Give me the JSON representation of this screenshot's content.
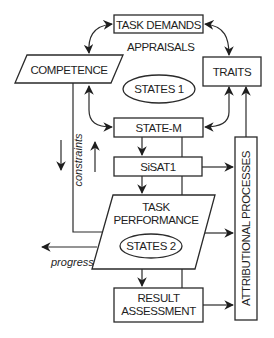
{
  "diagram": {
    "nodes": {
      "task_demands": "TASK DEMANDS",
      "appraisals": "APPRAISALS",
      "competence": "COMPETENCE",
      "traits": "TRAITS",
      "states1": "STATES 1",
      "state_m": "STATE-M",
      "sisat1": "SiSAT1",
      "task_performance_line1": "TASK",
      "task_performance_line2": "PERFORMANCE",
      "states2": "STATES 2",
      "result_assessment_line1": "RESULT",
      "result_assessment_line2": "ASSESSMENT",
      "attributional_processes": "ATTRIBUTIONAL PROCESSES"
    },
    "edge_labels": {
      "constraints": "constraints",
      "progress": "progress"
    },
    "edges": [
      {
        "from": "task_demands",
        "to": "competence",
        "type": "bidirectional"
      },
      {
        "from": "task_demands",
        "to": "traits",
        "type": "bidirectional"
      },
      {
        "from": "competence",
        "to": "state_m",
        "type": "bidirectional"
      },
      {
        "from": "traits",
        "to": "state_m",
        "type": "directed"
      },
      {
        "from": "attributional_processes",
        "to": "traits",
        "type": "directed"
      },
      {
        "from": "state_m",
        "to": "sisat1",
        "type": "directed"
      },
      {
        "from": "sisat1",
        "to": "task_performance",
        "type": "directed"
      },
      {
        "from": "sisat1",
        "to": "attributional_processes",
        "type": "directed"
      },
      {
        "from": "competence",
        "to": "task_performance",
        "type": "line",
        "label": "constraints"
      },
      {
        "from": "task_performance",
        "to": "attributional_processes",
        "type": "directed"
      },
      {
        "from": "task_performance",
        "to": "outside",
        "type": "directed",
        "label": "progress"
      },
      {
        "from": "task_performance",
        "to": "result_assessment",
        "type": "directed"
      },
      {
        "from": "result_assessment",
        "to": "attributional_processes",
        "type": "directed"
      }
    ]
  }
}
